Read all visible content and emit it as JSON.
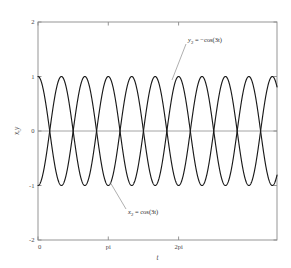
{
  "chart_data": {
    "type": "line",
    "title": "",
    "xlabel": "t",
    "ylabel": "x,y",
    "xlim": [
      0,
      10.681
    ],
    "ylim": [
      -2,
      2
    ],
    "grid": false,
    "legend_position": "annotations-inline",
    "x_tick_values": [
      0,
      3.14159,
      6.28319
    ],
    "x_tick_labels": [
      "0",
      "pi",
      "2pi"
    ],
    "y_tick_values": [
      2,
      1,
      0,
      -1,
      -2
    ],
    "y_tick_labels": [
      "2",
      "1",
      "0",
      "-1",
      "-2"
    ],
    "zero_reference_line": 0,
    "series": [
      {
        "name": "x2",
        "label": "x_2 = cos(3t)",
        "expression": "cos(3*t)",
        "amplitude": 1,
        "frequency": 3,
        "phase": 0,
        "color": "#1a1a1a"
      },
      {
        "name": "y2",
        "label": "y_2 = -cos(3t)",
        "expression": "-cos(3*t)",
        "amplitude": 1,
        "frequency": 3,
        "phase": 3.14159,
        "color": "#1a1a1a"
      }
    ],
    "annotations": [
      {
        "id": "annot-y2",
        "var": "y",
        "sub": "2",
        "rest": " = −cos(3t)",
        "text": "y2 = -cos(3t)",
        "text_x": 188,
        "text_y": 42,
        "leader_from_x": 186,
        "leader_from_y": 44,
        "leader_to_x": 172,
        "leader_to_y": 80
      },
      {
        "id": "annot-x2",
        "var": "x",
        "sub": "2",
        "rest": " = cos(3t)",
        "text": "x2 = cos(3t)",
        "text_x": 128,
        "text_y": 214,
        "leader_from_x": 126,
        "leader_from_y": 209,
        "leader_to_x": 110,
        "leader_to_y": 182
      }
    ]
  },
  "plot_geometry": {
    "left": 38,
    "right": 277,
    "top": 22,
    "bottom": 240
  },
  "colors": {
    "curve": "#1a1a1a",
    "axis": "#8a8a8a",
    "zero_line": "#9a9a9a",
    "background": "#ffffff",
    "text": "#4a4a4a"
  }
}
